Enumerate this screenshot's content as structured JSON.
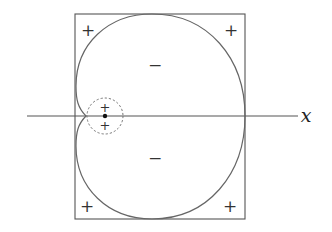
{
  "diagram": {
    "type": "sign-region diagram of a cardioid-like curve inside a square",
    "axis": {
      "label": "x"
    },
    "regions": {
      "corner_signs": [
        "+",
        "+",
        "+",
        "+"
      ],
      "inside_signs": [
        "−",
        "−"
      ],
      "small_circle_signs": [
        "+",
        "+"
      ]
    },
    "colors": {
      "stroke": "#555555",
      "text": "#333333",
      "background": "#ffffff"
    }
  }
}
